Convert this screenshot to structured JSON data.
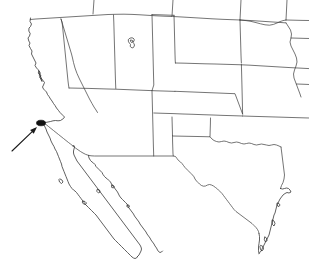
{
  "figure": {
    "background_color": "#ffffff",
    "line_color": "#3a3a3a",
    "coast_color": "#2b2b2b",
    "marker_color": "#111111",
    "pointer_color": "#1a1a1a",
    "width": 309,
    "height": 275
  },
  "annotation": {
    "marker": {
      "name": "study-site-marker",
      "shape": "filled-ellipse",
      "center_x": 41,
      "center_y": 123,
      "radius_x": 4.5,
      "radius_y": 2.8,
      "label": ""
    },
    "pointer": {
      "name": "leader-arrow",
      "tail_x": 12,
      "tail_y": 151,
      "tip_x": 37,
      "tip_y": 127,
      "label": ""
    }
  },
  "regions": {
    "states": [
      "Washington",
      "Oregon",
      "Idaho",
      "Montana",
      "Wyoming",
      "North Dakota",
      "South Dakota",
      "Nebraska",
      "Kansas",
      "Oklahoma",
      "Colorado",
      "Utah",
      "Nevada",
      "California",
      "Arizona",
      "New Mexico",
      "Texas"
    ],
    "water_features": [
      "Great Salt Lake",
      "Gulf of California",
      "Gulf of Mexico",
      "Pacific Ocean",
      "San Francisco Bay"
    ],
    "other": [
      "Baja California Peninsula"
    ]
  }
}
